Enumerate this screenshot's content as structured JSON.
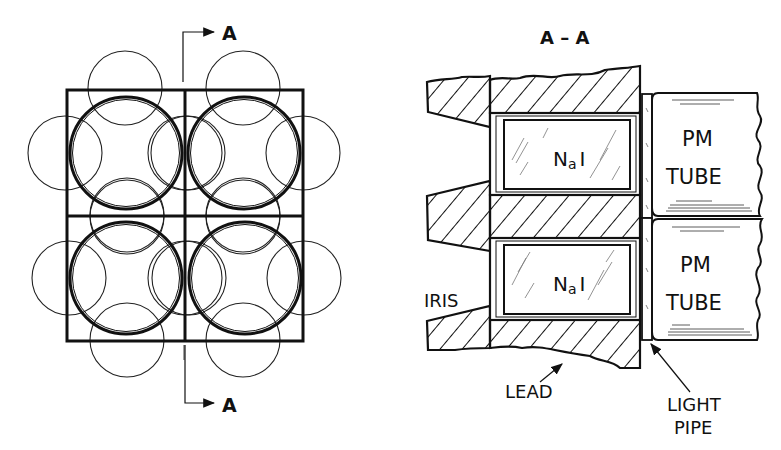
{
  "figure": {
    "type": "technical-drawing",
    "views": {
      "plan": {
        "name": "plan-view",
        "section_marker_top": "A",
        "section_marker_bottom": "A",
        "grid": {
          "rows": 2,
          "cols": 2
        },
        "detector_circles": 4,
        "overlap_circles_per_detector": 4
      },
      "section": {
        "title": "A – A",
        "crystal_labels": [
          "NaI",
          "NaI"
        ],
        "crystal_label_main": "N",
        "crystal_label_sub": "a",
        "crystal_label_tail": "I",
        "tube_labels": [
          {
            "line1": "PM",
            "line2": "TUBE"
          },
          {
            "line1": "PM",
            "line2": "TUBE"
          }
        ],
        "callouts": {
          "iris": "IRIS",
          "lead": "LEAD",
          "light_pipe_line1": "LIGHT",
          "light_pipe_line2": "PIPE"
        }
      }
    },
    "colors": {
      "ink": "#111111",
      "paper": "#ffffff"
    }
  }
}
